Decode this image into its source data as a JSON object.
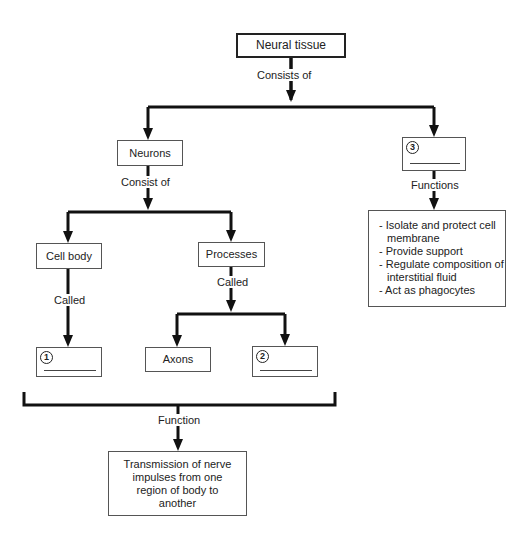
{
  "diagram": {
    "root": {
      "label": "Neural tissue"
    },
    "root_link": "Consists of",
    "neurons": {
      "label": "Neurons",
      "link": "Consist of"
    },
    "cell_body": {
      "label": "Cell body",
      "link": "Called"
    },
    "processes": {
      "label": "Processes",
      "link": "Called"
    },
    "blank1": {
      "number": "1",
      "answer": ""
    },
    "axons": {
      "label": "Axons"
    },
    "blank2": {
      "number": "2",
      "answer": ""
    },
    "blank3": {
      "number": "3",
      "answer": "",
      "link": "Functions"
    },
    "functions_list": [
      "- Isolate and protect cell membrane",
      "- Provide support",
      "- Regulate composition of interstitial fluid",
      "- Act as phagocytes"
    ],
    "function_link": "Function",
    "function_result": "Transmission of nerve impulses from one region of body to another"
  }
}
